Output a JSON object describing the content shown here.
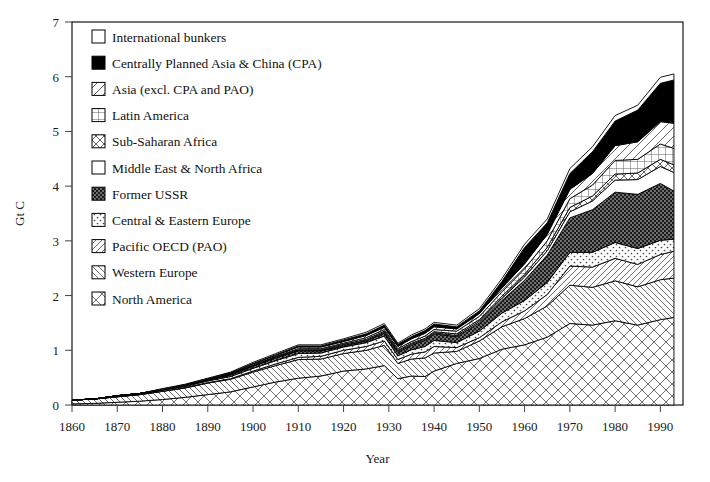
{
  "chart_data": {
    "type": "area",
    "title": "",
    "subtitle": "",
    "xlabel": "Year",
    "ylabel": "Gt C",
    "xlim": [
      1860,
      1995
    ],
    "ylim": [
      0,
      7
    ],
    "xticks": [
      1860,
      1870,
      1880,
      1890,
      1900,
      1910,
      1920,
      1930,
      1940,
      1950,
      1960,
      1970,
      1980,
      1990
    ],
    "yticks": [
      0,
      1,
      2,
      3,
      4,
      5,
      6,
      7
    ],
    "grid": false,
    "stacked": true,
    "legend_position": "upper-left inside plot",
    "legend_order_top_to_bottom": [
      "International bunkers",
      "Centrally Planned Asia & China (CPA)",
      "Asia (excl. CPA and PAO)",
      "Latin America",
      "Sub-Saharan Africa",
      "Middle East & North Africa",
      "Former USSR",
      "Central & Eastern Europe",
      "Pacific OECD (PAO)",
      "Western Europe",
      "North America"
    ],
    "x": [
      1860,
      1865,
      1870,
      1875,
      1880,
      1885,
      1890,
      1895,
      1900,
      1905,
      1910,
      1915,
      1920,
      1925,
      1929,
      1932,
      1935,
      1938,
      1940,
      1945,
      1950,
      1955,
      1960,
      1965,
      1970,
      1975,
      1980,
      1985,
      1990,
      1993
    ],
    "series": [
      {
        "name": "North America",
        "pattern": "diamond-cross",
        "values": [
          0.02,
          0.03,
          0.05,
          0.07,
          0.1,
          0.14,
          0.19,
          0.24,
          0.33,
          0.42,
          0.49,
          0.53,
          0.62,
          0.66,
          0.72,
          0.48,
          0.53,
          0.52,
          0.62,
          0.76,
          0.85,
          1.02,
          1.1,
          1.24,
          1.49,
          1.46,
          1.54,
          1.46,
          1.56,
          1.6
        ]
      },
      {
        "name": "Western Europe",
        "pattern": "diag-back",
        "values": [
          0.07,
          0.08,
          0.1,
          0.12,
          0.15,
          0.17,
          0.21,
          0.23,
          0.27,
          0.3,
          0.34,
          0.31,
          0.32,
          0.34,
          0.37,
          0.28,
          0.31,
          0.34,
          0.33,
          0.22,
          0.32,
          0.41,
          0.48,
          0.57,
          0.7,
          0.69,
          0.73,
          0.7,
          0.73,
          0.72
        ]
      },
      {
        "name": "Pacific OECD (PAO)",
        "pattern": "diag-fwd",
        "values": [
          0.0,
          0.0,
          0.0,
          0.0,
          0.0,
          0.01,
          0.01,
          0.01,
          0.02,
          0.03,
          0.04,
          0.05,
          0.06,
          0.07,
          0.08,
          0.07,
          0.09,
          0.11,
          0.12,
          0.07,
          0.06,
          0.09,
          0.14,
          0.21,
          0.35,
          0.37,
          0.41,
          0.41,
          0.46,
          0.49
        ]
      },
      {
        "name": "Central & Eastern Europe",
        "pattern": "dots-light",
        "values": [
          0.0,
          0.0,
          0.01,
          0.01,
          0.02,
          0.02,
          0.03,
          0.04,
          0.05,
          0.06,
          0.07,
          0.06,
          0.06,
          0.07,
          0.09,
          0.07,
          0.08,
          0.1,
          0.11,
          0.09,
          0.12,
          0.16,
          0.19,
          0.22,
          0.25,
          0.27,
          0.29,
          0.29,
          0.26,
          0.22
        ]
      },
      {
        "name": "Former USSR",
        "pattern": "dots-dark",
        "values": [
          0.0,
          0.0,
          0.01,
          0.01,
          0.01,
          0.02,
          0.02,
          0.03,
          0.04,
          0.05,
          0.05,
          0.04,
          0.02,
          0.03,
          0.05,
          0.06,
          0.08,
          0.11,
          0.12,
          0.11,
          0.15,
          0.23,
          0.37,
          0.5,
          0.63,
          0.78,
          0.92,
          0.99,
          1.04,
          0.88
        ]
      },
      {
        "name": "Middle East & North Africa",
        "pattern": "blank",
        "values": [
          0.0,
          0.0,
          0.0,
          0.0,
          0.0,
          0.0,
          0.0,
          0.0,
          0.0,
          0.01,
          0.01,
          0.01,
          0.01,
          0.01,
          0.02,
          0.02,
          0.02,
          0.02,
          0.02,
          0.02,
          0.03,
          0.04,
          0.06,
          0.08,
          0.11,
          0.16,
          0.22,
          0.27,
          0.31,
          0.34
        ]
      },
      {
        "name": "Sub-Saharan Africa",
        "pattern": "x-cross",
        "values": [
          0.0,
          0.0,
          0.0,
          0.0,
          0.0,
          0.0,
          0.0,
          0.01,
          0.01,
          0.01,
          0.01,
          0.01,
          0.02,
          0.02,
          0.02,
          0.02,
          0.02,
          0.02,
          0.02,
          0.03,
          0.03,
          0.04,
          0.05,
          0.06,
          0.08,
          0.09,
          0.11,
          0.12,
          0.13,
          0.14
        ]
      },
      {
        "name": "Latin America",
        "pattern": "grid-cross",
        "values": [
          0.0,
          0.0,
          0.0,
          0.0,
          0.0,
          0.0,
          0.01,
          0.01,
          0.01,
          0.01,
          0.02,
          0.02,
          0.02,
          0.03,
          0.03,
          0.03,
          0.03,
          0.04,
          0.04,
          0.05,
          0.06,
          0.08,
          0.1,
          0.12,
          0.16,
          0.2,
          0.25,
          0.25,
          0.28,
          0.3
        ]
      },
      {
        "name": "Asia (excl. CPA and PAO)",
        "pattern": "diag-fwd-wide",
        "values": [
          0.0,
          0.0,
          0.0,
          0.0,
          0.01,
          0.01,
          0.01,
          0.01,
          0.02,
          0.02,
          0.03,
          0.03,
          0.03,
          0.04,
          0.04,
          0.04,
          0.05,
          0.05,
          0.05,
          0.04,
          0.05,
          0.07,
          0.09,
          0.12,
          0.17,
          0.21,
          0.27,
          0.32,
          0.41,
          0.46
        ]
      },
      {
        "name": "Centrally Planned Asia & China (CPA)",
        "pattern": "solid-black",
        "values": [
          0.0,
          0.0,
          0.0,
          0.0,
          0.0,
          0.0,
          0.0,
          0.01,
          0.01,
          0.01,
          0.02,
          0.02,
          0.03,
          0.03,
          0.04,
          0.04,
          0.04,
          0.05,
          0.05,
          0.04,
          0.05,
          0.12,
          0.3,
          0.21,
          0.29,
          0.4,
          0.45,
          0.58,
          0.7,
          0.79
        ]
      },
      {
        "name": "International bunkers",
        "pattern": "blank",
        "values": [
          0.0,
          0.0,
          0.0,
          0.0,
          0.01,
          0.01,
          0.01,
          0.01,
          0.02,
          0.02,
          0.02,
          0.02,
          0.02,
          0.03,
          0.03,
          0.02,
          0.03,
          0.03,
          0.03,
          0.03,
          0.04,
          0.05,
          0.06,
          0.07,
          0.09,
          0.09,
          0.1,
          0.09,
          0.11,
          0.11
        ]
      }
    ]
  },
  "axes": {
    "ylabel": "Gt C",
    "xlabel": "Year",
    "xticklabels": [
      "1860",
      "1870",
      "1880",
      "1890",
      "1900",
      "1910",
      "1920",
      "1930",
      "1940",
      "1950",
      "1960",
      "1970",
      "1980",
      "1990"
    ],
    "yticklabels": [
      "0",
      "1",
      "2",
      "3",
      "4",
      "5",
      "6",
      "7"
    ]
  },
  "legend": {
    "items": [
      {
        "label": "International bunkers",
        "pattern": "blank"
      },
      {
        "label": "Centrally Planned Asia & China (CPA)",
        "pattern": "solid-black"
      },
      {
        "label": "Asia (excl. CPA and PAO)",
        "pattern": "diag-fwd-wide"
      },
      {
        "label": "Latin America",
        "pattern": "grid-cross"
      },
      {
        "label": "Sub-Saharan Africa",
        "pattern": "x-cross"
      },
      {
        "label": "Middle East & North Africa",
        "pattern": "blank"
      },
      {
        "label": "Former USSR",
        "pattern": "dots-dark"
      },
      {
        "label": "Central & Eastern Europe",
        "pattern": "dots-light"
      },
      {
        "label": "Pacific OECD (PAO)",
        "pattern": "diag-fwd"
      },
      {
        "label": "Western Europe",
        "pattern": "diag-back"
      },
      {
        "label": "North America",
        "pattern": "diamond-cross"
      }
    ]
  },
  "colors": {
    "ink": "#000000",
    "background": "#ffffff",
    "tick_text": "#1a1a1a"
  }
}
